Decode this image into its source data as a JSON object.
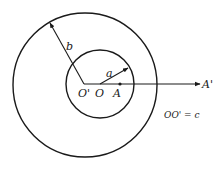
{
  "diagram": {
    "type": "eccentric-circles",
    "labels": {
      "outer_radius": "b",
      "inner_radius": "a",
      "outer_center": "O'",
      "inner_center": "O",
      "point_a": "A",
      "point_a_prime": "A'",
      "relation": "OO' = c"
    },
    "colors": {
      "stroke": "#1a1a1a",
      "background": "#ffffff"
    }
  }
}
